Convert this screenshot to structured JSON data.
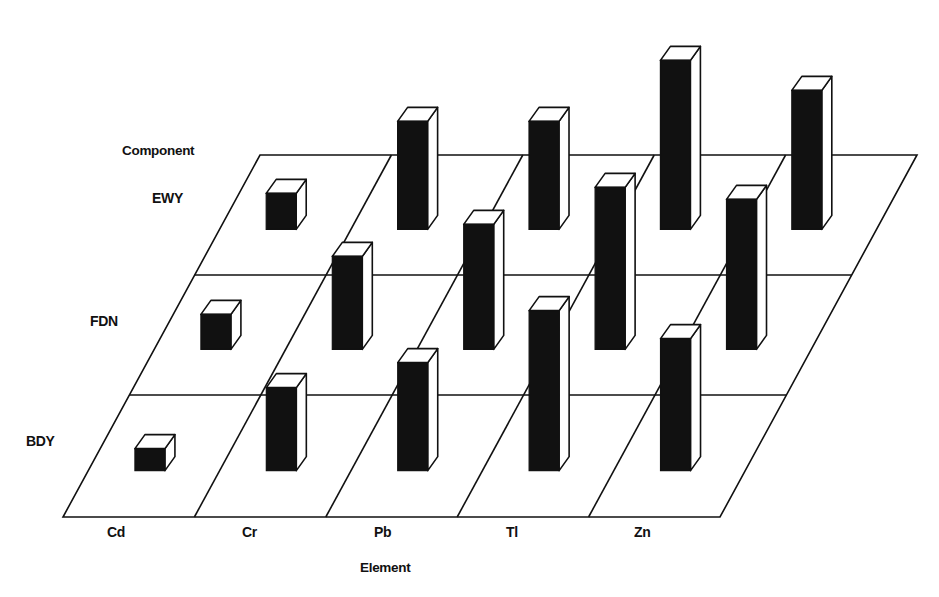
{
  "chart_data": {
    "type": "bar",
    "subtype": "3d-bar-grid",
    "title": "",
    "xlabel": "Element",
    "ylabel": "Component",
    "categories": [
      "Cd",
      "Cr",
      "Pb",
      "Tl",
      "Zn"
    ],
    "rows": [
      "BDY",
      "FDN",
      "EWY"
    ],
    "value_units": "relative bar height (no numeric axis shown)",
    "series": [
      {
        "name": "BDY",
        "values": [
          22,
          83,
          108,
          160,
          132
        ]
      },
      {
        "name": "FDN",
        "values": [
          35,
          93,
          125,
          162,
          150
        ]
      },
      {
        "name": "EWY",
        "values": [
          36,
          108,
          108,
          169,
          139
        ]
      }
    ],
    "grid": true,
    "legend": "none",
    "colors": {
      "bar_front": "#111111",
      "bar_top": "#ffffff",
      "bar_side": "#ffffff",
      "lines": "#111111",
      "background": "#ffffff"
    }
  },
  "labels": {
    "component_axis": "Component",
    "element_axis": "Element",
    "rows": [
      "BDY",
      "FDN",
      "EWY"
    ],
    "columns": [
      "Cd",
      "Cr",
      "Pb",
      "Tl",
      "Zn"
    ]
  }
}
